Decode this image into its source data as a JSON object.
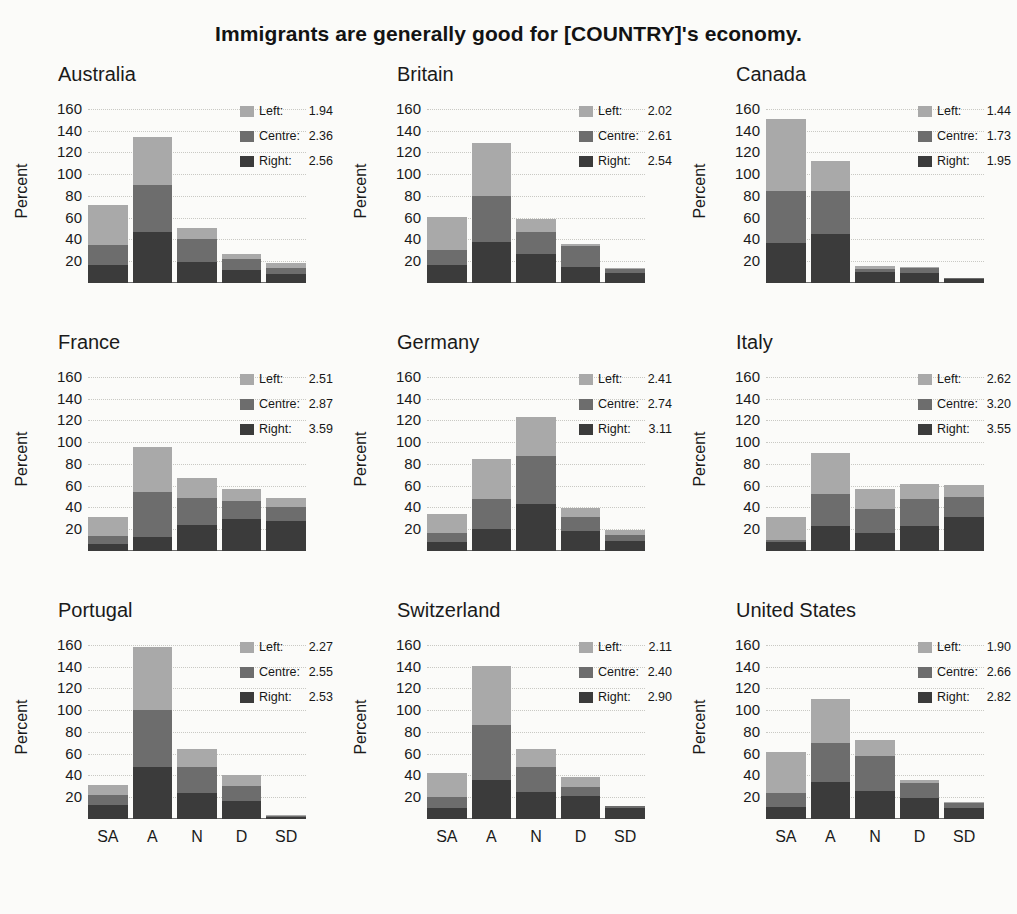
{
  "title": "Immigrants are generally good for [COUNTRY]'s economy.",
  "axis": {
    "ylabel": "Percent",
    "yticks": [
      20,
      40,
      60,
      80,
      100,
      120,
      140,
      160
    ],
    "ymax": 170,
    "xcategories": [
      "SA",
      "A",
      "N",
      "D",
      "SD"
    ]
  },
  "legend": {
    "series": [
      "Left",
      "Centre",
      "Right"
    ],
    "labels": {
      "left": "Left:",
      "centre": "Centre:",
      "right": "Right:"
    }
  },
  "colors": {
    "left": "#a9a9a9",
    "centre": "#6d6d6d",
    "right": "#3b3b3b",
    "background": "#fbfbf9",
    "text": "#1a1a1a",
    "grid": "#c9c9c4"
  },
  "chart_data": {
    "type": "bar",
    "subtype": "stacked-bar small multiples",
    "title": "Immigrants are generally good for [COUNTRY]'s economy.",
    "xlabel": "",
    "ylabel": "Percent",
    "ylim": [
      0,
      170
    ],
    "yticks": [
      20,
      40,
      60,
      80,
      100,
      120,
      140,
      160
    ],
    "categories": [
      "SA",
      "A",
      "N",
      "D",
      "SD"
    ],
    "grid": true,
    "legend_position": "top-right inside each panel",
    "stack_order": [
      "Right",
      "Centre",
      "Left"
    ],
    "panels": [
      {
        "name": "Australia",
        "means": {
          "left": 1.94,
          "centre": 2.36,
          "right": 2.56
        },
        "series": [
          {
            "name": "Right",
            "values": [
              17,
              47,
              19,
              12,
              8
            ]
          },
          {
            "name": "Centre",
            "values": [
              18,
              43,
              21,
              10,
              6
            ]
          },
          {
            "name": "Left",
            "values": [
              37,
              44,
              11,
              5,
              4
            ]
          }
        ],
        "totals": [
          72,
          134,
          51,
          27,
          18
        ]
      },
      {
        "name": "Britain",
        "means": {
          "left": 2.02,
          "centre": 2.61,
          "right": 2.54
        },
        "series": [
          {
            "name": "Right",
            "values": [
              17,
              38,
              27,
              15,
              9
            ]
          },
          {
            "name": "Centre",
            "values": [
              13,
              42,
              20,
              19,
              4
            ]
          },
          {
            "name": "Left",
            "values": [
              31,
              49,
              12,
              2,
              1
            ]
          }
        ],
        "totals": [
          61,
          129,
          59,
          36,
          14
        ]
      },
      {
        "name": "Canada",
        "means": {
          "left": 1.44,
          "centre": 1.73,
          "right": 1.95
        },
        "series": [
          {
            "name": "Right",
            "values": [
              37,
              45,
              10,
              9,
              4
            ]
          },
          {
            "name": "Centre",
            "values": [
              48,
              40,
              3,
              5,
              1
            ]
          },
          {
            "name": "Left",
            "values": [
              66,
              27,
              3,
              1,
              0
            ]
          }
        ],
        "totals": [
          151,
          112,
          16,
          15,
          5
        ]
      },
      {
        "name": "France",
        "means": {
          "left": 2.51,
          "centre": 2.87,
          "right": 3.59
        },
        "series": [
          {
            "name": "Right",
            "values": [
              6,
              13,
              24,
              29,
              28
            ]
          },
          {
            "name": "Centre",
            "values": [
              8,
              41,
              25,
              17,
              12
            ]
          },
          {
            "name": "Left",
            "values": [
              17,
              42,
              18,
              11,
              9
            ]
          }
        ],
        "totals": [
          31,
          96,
          67,
          57,
          49
        ]
      },
      {
        "name": "Germany",
        "means": {
          "left": 2.41,
          "centre": 2.74,
          "right": 3.11
        },
        "series": [
          {
            "name": "Right",
            "values": [
              8,
              20,
              43,
              18,
              9
            ]
          },
          {
            "name": "Centre",
            "values": [
              9,
              28,
              44,
              13,
              6
            ]
          },
          {
            "name": "Left",
            "values": [
              17,
              37,
              36,
              9,
              4
            ]
          }
        ],
        "totals": [
          34,
          85,
          123,
          40,
          19
        ]
      },
      {
        "name": "Italy",
        "means": {
          "left": 2.62,
          "centre": 3.2,
          "right": 3.55
        },
        "series": [
          {
            "name": "Right",
            "values": [
              8,
              23,
              17,
              23,
              31
            ]
          },
          {
            "name": "Centre",
            "values": [
              2,
              29,
              22,
              25,
              19
            ]
          },
          {
            "name": "Left",
            "values": [
              21,
              38,
              18,
              14,
              11
            ]
          }
        ],
        "totals": [
          31,
          90,
          57,
          62,
          61
        ]
      },
      {
        "name": "Portugal",
        "means": {
          "left": 2.27,
          "centre": 2.55,
          "right": 2.53
        },
        "series": [
          {
            "name": "Right",
            "values": [
              13,
              48,
              24,
              17,
              2
            ]
          },
          {
            "name": "Centre",
            "values": [
              9,
              52,
              24,
              13,
              1
            ]
          },
          {
            "name": "Left",
            "values": [
              9,
              58,
              16,
              10,
              1
            ]
          }
        ],
        "totals": [
          31,
          158,
          64,
          40,
          4
        ]
      },
      {
        "name": "Switzerland",
        "means": {
          "left": 2.11,
          "centre": 2.4,
          "right": 2.9
        },
        "series": [
          {
            "name": "Right",
            "values": [
              10,
              36,
              25,
              21,
              10
            ]
          },
          {
            "name": "Centre",
            "values": [
              10,
              50,
              23,
              8,
              2
            ]
          },
          {
            "name": "Left",
            "values": [
              22,
              55,
              16,
              10,
              0
            ]
          }
        ],
        "totals": [
          42,
          141,
          64,
          39,
          12
        ]
      },
      {
        "name": "United States",
        "means": {
          "left": 1.9,
          "centre": 2.66,
          "right": 2.82
        },
        "series": [
          {
            "name": "Right",
            "values": [
              11,
              34,
              26,
              19,
              10
            ]
          },
          {
            "name": "Centre",
            "values": [
              13,
              36,
              32,
              14,
              5
            ]
          },
          {
            "name": "Left",
            "values": [
              38,
              40,
              15,
              3,
              1
            ]
          }
        ],
        "totals": [
          62,
          110,
          73,
          36,
          16
        ]
      }
    ]
  }
}
